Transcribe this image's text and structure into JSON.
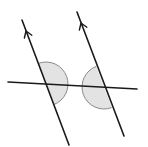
{
  "diagram": {
    "colors": {
      "background": "#ffffff",
      "line": "#1a1a1a",
      "angle_fill": "#e3e3e3",
      "angle_stroke": "#8a8a8a"
    },
    "parallel_lines": [
      {
        "name": "left-parallel-line",
        "x1": 22,
        "y1": 20,
        "x2": 69,
        "y2": 145,
        "arrow": {
          "x": 26,
          "y": 31
        }
      },
      {
        "name": "right-parallel-line",
        "x1": 77,
        "y1": 12,
        "x2": 124,
        "y2": 136,
        "arrow": {
          "x": 81,
          "y": 23
        }
      }
    ],
    "transversal": {
      "x1": 8,
      "y1": 82,
      "x2": 137,
      "y2": 89
    },
    "angles": [
      {
        "name": "left-co-interior-angle",
        "cx": 46,
        "cy": 84,
        "r": 22,
        "side": "right"
      },
      {
        "name": "right-co-interior-angle",
        "cx": 104,
        "cy": 87,
        "r": 22,
        "side": "left"
      }
    ]
  }
}
